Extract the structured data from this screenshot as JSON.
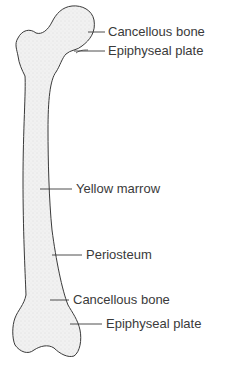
{
  "figure": {
    "colors": {
      "outline": "#3a3a3a",
      "fill": "#eeeeee",
      "text": "#3a3a3a"
    },
    "labels": [
      {
        "id": "cancellous-bone-top",
        "text": "Cancellous bone"
      },
      {
        "id": "epiphyseal-plate-top",
        "text": "Epiphyseal plate"
      },
      {
        "id": "yellow-marrow",
        "text": "Yellow marrow"
      },
      {
        "id": "periosteum",
        "text": "Periosteum"
      },
      {
        "id": "cancellous-bone-bottom",
        "text": "Cancellous bone"
      },
      {
        "id": "epiphyseal-plate-bottom",
        "text": "Epiphyseal plate"
      }
    ]
  }
}
